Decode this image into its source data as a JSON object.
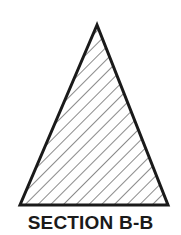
{
  "diagram": {
    "caption": "SECTION B-B",
    "shape": "triangle",
    "fill_pattern": "diagonal-hatch",
    "stroke_color": "#1a1a1a",
    "background": "#ffffff"
  }
}
